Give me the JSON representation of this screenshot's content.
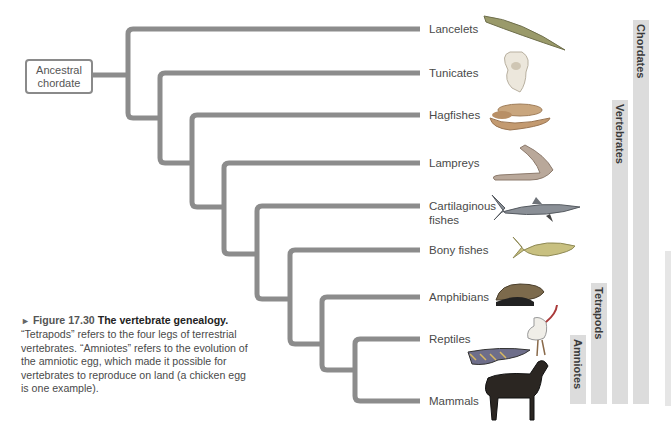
{
  "diagram": {
    "type": "cladogram",
    "root": {
      "label_line1": "Ancestral",
      "label_line2": "chordate"
    },
    "taxa": [
      {
        "name": "Lancelets",
        "label_line1": "Lancelets",
        "label_line2": "",
        "y": 29,
        "branch_x": 128,
        "icon": "lancelet-icon"
      },
      {
        "name": "Tunicates",
        "label_line1": "Tunicates",
        "label_line2": "",
        "y": 73,
        "branch_x": 160,
        "icon": "tunicate-icon"
      },
      {
        "name": "Hagfishes",
        "label_line1": "Hagfishes",
        "label_line2": "",
        "y": 115,
        "branch_x": 192,
        "icon": "hagfish-icon"
      },
      {
        "name": "Lampreys",
        "label_line1": "Lampreys",
        "label_line2": "",
        "y": 163,
        "branch_x": 224,
        "icon": "lamprey-icon"
      },
      {
        "name": "Cartilaginous fishes",
        "label_line1": "Cartilaginous",
        "label_line2": "fishes",
        "y": 206,
        "branch_x": 257,
        "icon": "shark-icon"
      },
      {
        "name": "Bony fishes",
        "label_line1": "Bony fishes",
        "label_line2": "",
        "y": 250,
        "branch_x": 290,
        "icon": "bony-fish-icon"
      },
      {
        "name": "Amphibians",
        "label_line1": "Amphibians",
        "label_line2": "",
        "y": 297,
        "branch_x": 322,
        "icon": "frog-icon"
      },
      {
        "name": "Reptiles",
        "label_line1": "Reptiles",
        "label_line2": "",
        "y": 339,
        "branch_x": 355,
        "icon": "bird-and-lizard-icon"
      },
      {
        "name": "Mammals",
        "label_line1": "Mammals",
        "label_line2": "",
        "y": 401,
        "branch_x": 355,
        "icon": "horse-icon"
      }
    ],
    "clades": [
      {
        "label": "Amniotes",
        "includes": [
          "Reptiles",
          "Mammals"
        ]
      },
      {
        "label": "Tetrapods",
        "includes": [
          "Amphibians",
          "Reptiles",
          "Mammals"
        ]
      },
      {
        "label": "Vertebrates",
        "includes": [
          "Hagfishes",
          "Lampreys",
          "Cartilaginous fishes",
          "Bony fishes",
          "Amphibians",
          "Reptiles",
          "Mammals"
        ]
      },
      {
        "label": "Chordates",
        "includes": [
          "Lancelets",
          "Tunicates",
          "Hagfishes",
          "Lampreys",
          "Cartilaginous fishes",
          "Bony fishes",
          "Amphibians",
          "Reptiles",
          "Mammals"
        ]
      }
    ],
    "colors": {
      "branch": "#8c8c8c",
      "clade_bar": "#dcdcdc",
      "text": "#4a4a4a"
    }
  },
  "caption": {
    "arrow": "►",
    "figure_number": "Figure 17.30",
    "title": "The vertebrate genealogy.",
    "body": "“Tetrapods” refers to the four legs of terrestrial vertebrates. “Amniotes” refers to the evolution of the amniotic egg, which made it possible for vertebrates to reproduce on land (a chicken egg is one example)."
  }
}
